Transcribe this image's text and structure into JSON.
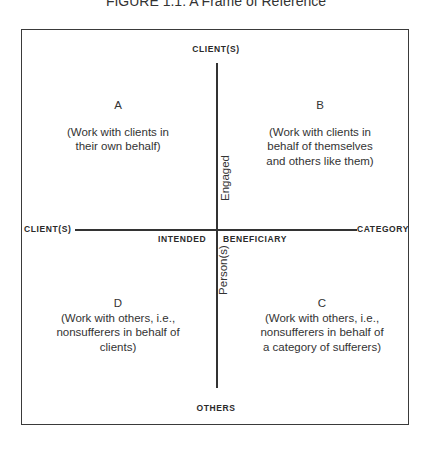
{
  "title": "FIGURE 1.1: A Frame of Reference",
  "axes": {
    "top": "CLIENT(S)",
    "bottom": "OTHERS",
    "left": "CLIENT(S)",
    "right": "CATEGORY",
    "horizontal_left_caption": "INTENDED",
    "horizontal_right_caption": "BENEFICIARY",
    "vertical_upper_caption": "Engaged",
    "vertical_lower_caption": "Person(s)"
  },
  "quadrants": {
    "a": {
      "letter": "A",
      "lines": [
        "(Work with clients in",
        "their own behalf)"
      ]
    },
    "b": {
      "letter": "B",
      "lines": [
        "(Work with clients in",
        "behalf of themselves",
        "and others like them)"
      ]
    },
    "c": {
      "letter": "C",
      "lines": [
        "(Work with others, i.e.,",
        "nonsufferers in behalf of",
        "a category of sufferers)"
      ]
    },
    "d": {
      "letter": "D",
      "lines": [
        "(Work with others, i.e.,",
        "nonsufferers in behalf of",
        "clients)"
      ]
    }
  }
}
